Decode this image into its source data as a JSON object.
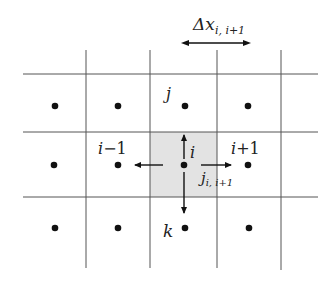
{
  "diagram": {
    "type": "finite-volume-grid",
    "colors": {
      "grid_line": "#555555",
      "shaded_cell": "#e3e3e3",
      "dot": "#111111",
      "arrow": "#111111",
      "text": "#222222"
    },
    "spacing_label": {
      "main": "Δx",
      "subscript": "i, i+1"
    },
    "labels": {
      "center": "i",
      "left_prefix": "i",
      "left_suffix": "−1",
      "right_prefix": "i",
      "right_suffix": "+1",
      "top": "j",
      "bottom": "k",
      "flux_main": "j",
      "flux_subscript": "i, i+1"
    },
    "grid": {
      "rows": 3,
      "cols": 5,
      "shaded_cell": {
        "row": 1,
        "col": 2
      }
    }
  }
}
